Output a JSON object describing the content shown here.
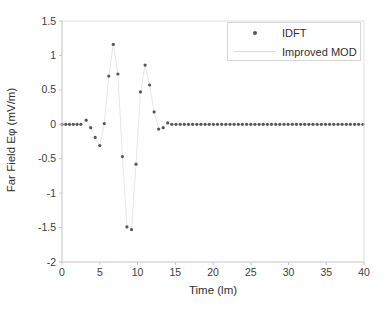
{
  "figure": {
    "background": "#ffffff"
  },
  "axes": {
    "xlabel": "Time (lm)",
    "ylabel": "Far Field Eφ (mV/m)",
    "x_tick_labels": [
      "0",
      "5",
      "10",
      "15",
      "20",
      "25",
      "30",
      "35",
      "40"
    ],
    "y_tick_labels": [
      "1.5",
      "1",
      "0.5",
      "0",
      "-0.5",
      "-1",
      "-1.5",
      "-2"
    ]
  },
  "legend": {
    "position": "top-right",
    "items": [
      {
        "label": "IDFT",
        "marker": "dot"
      },
      {
        "label": "Improved MOD",
        "marker": "line"
      }
    ]
  },
  "colors": {
    "idft_marker": "#575757",
    "improved_mod_line": "#e3e3e3",
    "axis_line": "#c6c6c6",
    "plot_border_light": "#dedede",
    "tick_label": "#3d3d3d",
    "legend_border": "#d6d6d6"
  },
  "chart_data": {
    "type": "scatter",
    "title": "",
    "xlabel": "Time (lm)",
    "ylabel": "Far Field Eφ (mV/m)",
    "xlim": [
      0,
      40
    ],
    "ylim": [
      -2,
      1.5
    ],
    "x_ticks": [
      0,
      5,
      10,
      15,
      20,
      25,
      30,
      35,
      40
    ],
    "y_ticks": [
      1.5,
      1,
      0.5,
      0,
      -0.5,
      -1,
      -1.5,
      -2
    ],
    "grid": false,
    "legend_position": "top-right",
    "series": [
      {
        "name": "IDFT",
        "style": "scatter-dot",
        "color": "#575757",
        "points": [
          [
            0,
            0
          ],
          [
            0.5,
            0
          ],
          [
            1,
            0
          ],
          [
            1.5,
            0
          ],
          [
            2,
            0
          ],
          [
            2.5,
            0
          ],
          [
            3.2,
            0.06
          ],
          [
            3.8,
            -0.05
          ],
          [
            4.4,
            -0.19
          ],
          [
            5,
            -0.31
          ],
          [
            5.6,
            0.01
          ],
          [
            6.2,
            0.7
          ],
          [
            6.8,
            1.16
          ],
          [
            7.4,
            0.73
          ],
          [
            8,
            -0.47
          ],
          [
            8.6,
            -1.49
          ],
          [
            9.2,
            -1.53
          ],
          [
            9.8,
            -0.58
          ],
          [
            10.4,
            0.47
          ],
          [
            11,
            0.86
          ],
          [
            11.6,
            0.57
          ],
          [
            12.2,
            0.18
          ],
          [
            12.8,
            -0.07
          ],
          [
            13.4,
            -0.05
          ],
          [
            14,
            0.02
          ],
          [
            14.55,
            0
          ],
          [
            15.1,
            0
          ],
          [
            15.65,
            0
          ],
          [
            16.2,
            0
          ],
          [
            16.75,
            0
          ],
          [
            17.3,
            0
          ],
          [
            17.85,
            0
          ],
          [
            18.4,
            0
          ],
          [
            18.95,
            0
          ],
          [
            19.5,
            0
          ],
          [
            20.05,
            0
          ],
          [
            20.6,
            0
          ],
          [
            21.15,
            0
          ],
          [
            21.7,
            0
          ],
          [
            22.25,
            0
          ],
          [
            22.8,
            0
          ],
          [
            23.35,
            0
          ],
          [
            23.9,
            0
          ],
          [
            24.45,
            0
          ],
          [
            25,
            0
          ],
          [
            25.55,
            0
          ],
          [
            26.1,
            0
          ],
          [
            26.65,
            0
          ],
          [
            27.2,
            0
          ],
          [
            27.75,
            0
          ],
          [
            28.3,
            0
          ],
          [
            28.85,
            0
          ],
          [
            29.4,
            0
          ],
          [
            29.95,
            0
          ],
          [
            30.5,
            0
          ],
          [
            31.05,
            0
          ],
          [
            31.6,
            0
          ],
          [
            32.15,
            0
          ],
          [
            32.7,
            0
          ],
          [
            33.25,
            0
          ],
          [
            33.8,
            0
          ],
          [
            34.35,
            0
          ],
          [
            34.9,
            0
          ],
          [
            35.45,
            0
          ],
          [
            36,
            0
          ],
          [
            36.55,
            0
          ],
          [
            37.1,
            0
          ],
          [
            37.65,
            0
          ],
          [
            38.2,
            0
          ],
          [
            38.75,
            0
          ],
          [
            39.3,
            0
          ],
          [
            39.85,
            0
          ]
        ]
      },
      {
        "name": "Improved MOD",
        "style": "line",
        "color": "#e3e3e3",
        "points_same_as": "IDFT",
        "note": "curve coincides with the IDFT samples"
      }
    ]
  }
}
